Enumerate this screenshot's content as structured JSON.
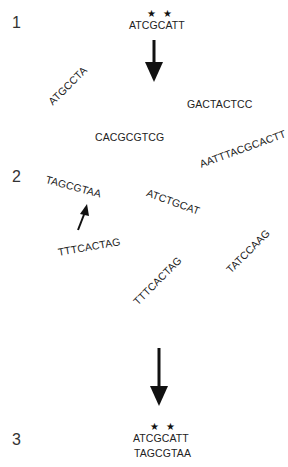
{
  "steps": [
    {
      "label": "1"
    },
    {
      "label": "2"
    },
    {
      "label": "3"
    }
  ],
  "step1": {
    "marks": [
      "★",
      "★"
    ],
    "sequence": "ATCGCATT"
  },
  "fragments": [
    {
      "text": "ATGCCTA",
      "rotation": -45
    },
    {
      "text": "GACTACTCC",
      "rotation": 0
    },
    {
      "text": "CACGCGTCG",
      "rotation": 0
    },
    {
      "text": "AATTTACGCACTT",
      "rotation": -20
    },
    {
      "text": "TAGCGTAA",
      "rotation": 15
    },
    {
      "text": "ATCTGCAT",
      "rotation": 20
    },
    {
      "text": "TTTCACTAG",
      "rotation": -10
    },
    {
      "text": "TTTCACTAG",
      "rotation": -45
    },
    {
      "text": "TATCCAAG",
      "rotation": -45
    }
  ],
  "step3": {
    "marks": [
      "★",
      "★"
    ],
    "sequence_top": "ATCGCATT",
    "sequence_bottom": "TAGCGTAA"
  },
  "arrows": [
    {
      "name": "down-arrow-1-to-2"
    },
    {
      "name": "pointer-arrow-to-match"
    },
    {
      "name": "down-arrow-2-to-3"
    }
  ]
}
